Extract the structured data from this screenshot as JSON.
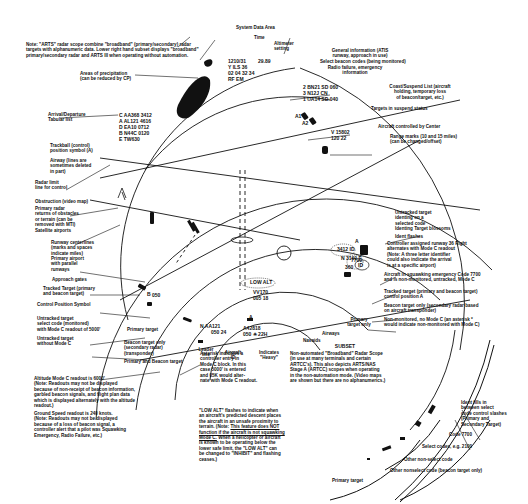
{
  "note_top": "Note: \"ARTS\" radar scope combine \"broadband\" (primary/secondary) radar targets with alphanumeric data. Lower right hand subset displays \"broadband\" primary/secondary radar and ARTS III when operating without automation.",
  "system_data_area": {
    "header": "System Data Area",
    "time_label": "Time",
    "altimeter_label": "Altimeter\nsetting",
    "lines": [
      "1210/31",
      "Y ILS 36",
      "02 04 32 34",
      "RF EM"
    ],
    "altimeter_value": "29.89",
    "general_info": "General information (ATIS\nrunway, approach in use)",
    "select_beacon": "Select beacon codes (being monitored)",
    "radio_failure": "Radio failure, emergency\ninformation"
  },
  "coast_list": {
    "lines": [
      "2 BN21 SD 060",
      "3 N12J CN",
      "1 UA14 SD 040"
    ],
    "label": "Coast/Suspend List (aircraft\nholding, temporary loss\nof beacon/target, etc.)"
  },
  "suspend": {
    "label": "Targets in suspend status",
    "a1": "A1",
    "a2": "A2"
  },
  "center": {
    "label": "Aircraft controlled by Center",
    "lines": [
      "V 15802",
      "120 22"
    ]
  },
  "range_marks": "Range marks (10 and 15 miles)\n(can be changed/offset)",
  "precipitation": "Areas of precipitation\n(can be reduced by CP)",
  "tabular": {
    "label": "Arrival/Departure\nTabular list",
    "lines": [
      "C  AA368 3412",
      "A  AL121 4616",
      "D  EA10 0712",
      "B  N44C 0120",
      "E  TW630"
    ]
  },
  "left_labels": {
    "trackball": "Trackball (control)\nposition symbol (A)",
    "airway": "Airway (lines are\nsometimes deleted\nin part)",
    "radar_limit": "Radar limit\nline for control",
    "obstruction": "Obstruction (video map)",
    "primary_returns": "Primary radar\nreturns of obstacles\nor terrain (can be\nremoved with MTI)",
    "satellite": "Satellite airports",
    "runway_center": "Runway centerlines\n(marks and spaces\nindicate miles)",
    "primary_airport": "Primary airport\nwith parallel\nrunways",
    "approach_gates": "Approach gates",
    "tracked_target": "Tracked Target (primary\nand beacon target)",
    "control_position": "Control Position Symbol",
    "untracked_select": "Untracked target\nselect code (monitored)\nwith Mode C readout of 5000'",
    "untracked_no_c": "Untracked target\nwithout Mode C",
    "primary_target": "Primary target",
    "beacon_only": "Beacon target only\n(secondary radar)\n(transponder)",
    "primary_beacon": "Primary and Beacon target"
  },
  "datablocks": {
    "tracked_alt": "050",
    "tracked_letter": "B",
    "aa121_line1": "N  AA121",
    "aa121_line2": "050 24",
    "a42": "A",
    "a42_line1": "A42818",
    "a42_line2": "050 ✳ 22H",
    "low_alt": "LOW ALT",
    "low_alt_line1": "VV170",
    "low_alt_line2": "005 18",
    "leader_line": "Leader\nline",
    "aircraft_id": "Aircraft\nID",
    "heavy": "Indicates\n\"Heavy\""
  },
  "right_labels": {
    "untracked_ident": "Untracked target\nidenting on a\nselected code",
    "ident_blossoms": "Identing Target blossoms",
    "ident_flashes": "Ident flashes",
    "runway_assign": "Controller assigned runway 36 Right\nalternates with Mode C readout\n(Note: A three letter identifier\ncould also indicate the arrival\nis at a specific airport)",
    "emergency": "Aircraft in squawking emergency Code 7700\nand is non-monitored, untracked, Mode C",
    "tracked_pos_a": "Tracked target (primary and beacon target)\ncontrol position A",
    "beacon_only_right": "Beacon target only (secondary radar based\non aircraft transponder)",
    "non_monitored": "Non-monitored, no Mode C (an asterisk *\nwould indicate non-monitored with Mode C)",
    "primary_only": "Primary\ntarget only",
    "airways": "Airways",
    "navaids": "Navaids"
  },
  "right_blocks": {
    "ident_code": "3412 ID",
    "n3160": "N  3160 F",
    "rwy": "36R",
    "id": "ID",
    "code7700": "7700",
    "code7700b": "040",
    "alt360": "360",
    "a_mark": "A"
  },
  "notes": {
    "asterisk": "Asterisk indicates a\ncontroller entry in\nMode C block. In this\ncase 5000' is entered\nand 05K would alter-\nnate with Mode C readout.",
    "low_alt_title": "\"LOW ALT\" flashes to indicate when\nan aircraft's predicted descent places\nthe aircraft in an unsafe proximity to\nterrain. (Note: ",
    "low_alt_underline": "This feature does NOT\nfunction if the aircraft is not squawking\nMode C.",
    "low_alt_rest": " When a helicopter or aircraft\nis known to be operating below the\nlower safe limit, the \"LOW ALT\" can\nbe changed to \"INHIBIT\" and flashing\nceases.)",
    "altitude": "Altitude Mode C readout is 6000'\n    (Note: Readouts may not be displayed\nbecause of non-receipt of beacon information,\ngarbled beacon signals, and flight plan data\nwhich is displayed alternately with the altitude\nreadout.)",
    "ground_speed": "Ground Speed readout is 240 knots.\n    (Note: Readouts may not be displayed\nbecause of a loss of beacon signal, a\ncontroller alert that a pilot was Squawking\nEmergency, Radio Failure, etc.)"
  },
  "subset": {
    "title": "SUBSET",
    "text": "Non-automated \"Broadband\" Radar Scope\n(in use at many terminals and certain\nARTCC's). This also depicts ARTS/NAS\nStage A (ARTCC) scopes when operating\nin the non-automation mode. (Video maps\nare shown but there are no alphanumerics.)",
    "ident_fills": "Ident fills in\nbetween select\ncode control slashes\n(Primary and\nSecondary Target)",
    "code7700": "Code 7700",
    "select_codes": "Select codes, e.g. 2100",
    "other_non_select": "Other non-select code",
    "other_nonselect_beacon": "Other nonselect code (beacon target only)",
    "primary_target": "Primary target"
  }
}
